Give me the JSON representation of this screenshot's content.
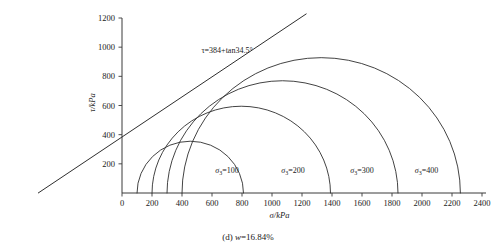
{
  "figure": {
    "caption": "(d)  w=16.84%",
    "caption_parts": {
      "index": "(d)",
      "variable": "w",
      "value": "16.84%"
    }
  },
  "chart_data": {
    "type": "line",
    "title": "",
    "xlabel": "σ/kPa",
    "ylabel": "τ/kPa",
    "xlim": [
      0,
      2400
    ],
    "ylim": [
      0,
      1200
    ],
    "grid": false,
    "legend_position": "inline-right-of-each-circle",
    "xticks": [
      0,
      200,
      400,
      600,
      800,
      1000,
      1200,
      1400,
      1600,
      1800,
      2000,
      2200,
      2400
    ],
    "xtick_labels": [
      "0",
      "200",
      "400",
      "600",
      "800",
      "1000",
      "1200",
      "1400",
      "1600",
      "1800",
      "2000",
      "2200",
      "2400"
    ],
    "yticks": [
      200,
      400,
      600,
      800,
      1000,
      1200
    ],
    "ytick_labels": [
      "200",
      "400",
      "600",
      "800",
      "1000",
      "1200"
    ],
    "annotations": [
      {
        "name": "failure-envelope-equation",
        "text": "τ=384+tan34.5°",
        "x": 700,
        "y": 960
      }
    ],
    "envelope": {
      "name": "failure-envelope",
      "intercept": 384,
      "friction_angle_deg": 34.5,
      "equation": "τ=384+tan34.5°",
      "x_start": -560,
      "x_end": 1230
    },
    "series": [
      {
        "name": "σ₃=100",
        "label_sigma": "σ",
        "label_sub": "3",
        "label_value": "=100",
        "sigma3": 100,
        "sigma1": 810,
        "center": 455,
        "radius": 355,
        "label_x": 700,
        "label_y": 140
      },
      {
        "name": "σ₃=200",
        "label_sigma": "σ",
        "label_sub": "3",
        "label_value": "=200",
        "sigma3": 200,
        "sigma1": 1390,
        "center": 795,
        "radius": 595,
        "label_x": 1140,
        "label_y": 140
      },
      {
        "name": "σ₃=300",
        "label_sigma": "σ",
        "label_sub": "3",
        "label_value": "=300",
        "sigma3": 300,
        "sigma1": 1840,
        "center": 1070,
        "radius": 770,
        "label_x": 1600,
        "label_y": 140
      },
      {
        "name": "σ₃=400",
        "label_sigma": "σ",
        "label_sub": "3",
        "label_value": "=400",
        "sigma3": 400,
        "sigma1": 2255,
        "center": 1328,
        "radius": 928,
        "label_x": 2030,
        "label_y": 140
      }
    ]
  }
}
